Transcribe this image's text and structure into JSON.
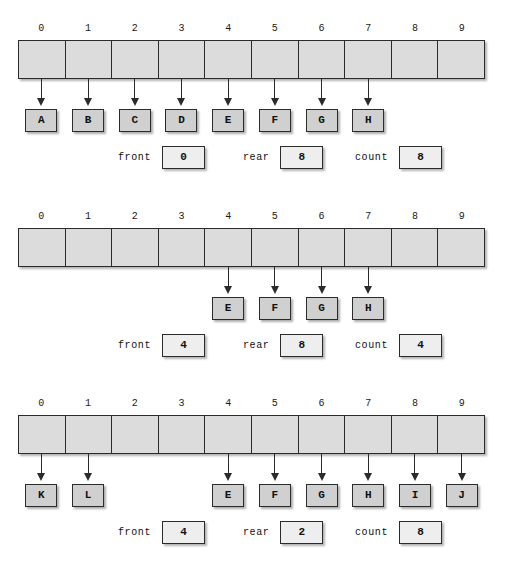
{
  "diagram": {
    "array_size": 10,
    "indices": [
      "0",
      "1",
      "2",
      "3",
      "4",
      "5",
      "6",
      "7",
      "8",
      "9"
    ],
    "colors": {
      "cell_fill": "#dcdcdc",
      "letter_fill": "#d0d0d0",
      "value_fill": "#eeeeee",
      "outline": "#2b2b2b",
      "background": "#ffffff"
    },
    "stat_labels": {
      "front": "front",
      "rear": "rear",
      "count": "count"
    },
    "snapshots": [
      {
        "name": "full-queue-front-at-zero",
        "top": 22,
        "elements": [
          {
            "index": 0,
            "letter": "A"
          },
          {
            "index": 1,
            "letter": "B"
          },
          {
            "index": 2,
            "letter": "C"
          },
          {
            "index": 3,
            "letter": "D"
          },
          {
            "index": 4,
            "letter": "E"
          },
          {
            "index": 5,
            "letter": "F"
          },
          {
            "index": 6,
            "letter": "G"
          },
          {
            "index": 7,
            "letter": "H"
          }
        ],
        "front": "0",
        "rear": "8",
        "count": "8"
      },
      {
        "name": "after-four-dequeues",
        "top": 210,
        "elements": [
          {
            "index": 4,
            "letter": "E"
          },
          {
            "index": 5,
            "letter": "F"
          },
          {
            "index": 6,
            "letter": "G"
          },
          {
            "index": 7,
            "letter": "H"
          }
        ],
        "front": "4",
        "rear": "8",
        "count": "4"
      },
      {
        "name": "wrapped-around-queue",
        "top": 397,
        "elements": [
          {
            "index": 0,
            "letter": "K"
          },
          {
            "index": 1,
            "letter": "L"
          },
          {
            "index": 4,
            "letter": "E"
          },
          {
            "index": 5,
            "letter": "F"
          },
          {
            "index": 6,
            "letter": "G"
          },
          {
            "index": 7,
            "letter": "H"
          },
          {
            "index": 8,
            "letter": "I"
          },
          {
            "index": 9,
            "letter": "J"
          }
        ],
        "front": "4",
        "rear": "2",
        "count": "8"
      }
    ]
  }
}
